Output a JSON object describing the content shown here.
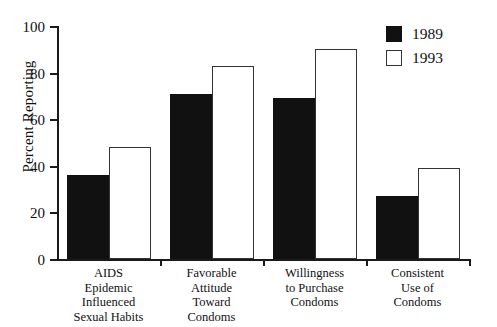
{
  "chart_data": {
    "type": "bar",
    "title": "",
    "subtitle": "",
    "xlabel": "",
    "ylabel": "Percent Reporting",
    "ylim": [
      0,
      100
    ],
    "yticks": [
      0,
      20,
      40,
      60,
      80,
      100
    ],
    "grid": false,
    "legend_position": "top-right",
    "categories": [
      "AIDS\nEpidemic\nInfluenced\nSexual Habits",
      "Favorable\nAttitude\nToward\nCondoms",
      "Willingness\nto Purchase\nCondoms",
      "Consistent\nUse of\nCondoms"
    ],
    "category_lines": [
      [
        "AIDS",
        "Epidemic",
        "Influenced",
        "Sexual Habits"
      ],
      [
        "Favorable",
        "Attitude",
        "Toward",
        "Condoms"
      ],
      [
        "Willingness",
        "to Purchase",
        "Condoms"
      ],
      [
        "Consistent",
        "Use of",
        "Condoms"
      ]
    ],
    "series": [
      {
        "name": "1989",
        "color": "#111111",
        "fill": "solid-black",
        "values": [
          36,
          71,
          69,
          27
        ]
      },
      {
        "name": "1993",
        "color": "#ffffff",
        "fill": "white-outlined",
        "values": [
          48,
          83,
          90,
          39
        ]
      }
    ]
  },
  "axis": {
    "y_title": "Percent Reporting",
    "y_tick_labels": [
      "100",
      "80",
      "60",
      "40",
      "20",
      "0"
    ]
  },
  "legend": {
    "entries": [
      {
        "label": "1989",
        "swatch": "black-square-swatch"
      },
      {
        "label": "1993",
        "swatch": "white-square-swatch"
      }
    ]
  },
  "colors": {
    "series_1989": "#111111",
    "series_1993": "#ffffff",
    "axis": "#1a1a1a",
    "text": "#111111",
    "background": "#ffffff"
  }
}
